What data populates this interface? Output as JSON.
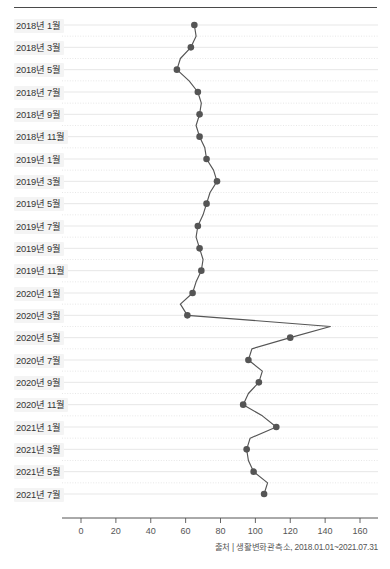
{
  "chart_data": {
    "type": "line",
    "orientation": "horizontal-time-vertical",
    "title": "",
    "subtitle": "",
    "xlabel": "",
    "ylabel": "",
    "xlim": [
      0,
      160
    ],
    "ylim_categories_order": "top-to-bottom chronological",
    "grid": true,
    "grid_axis": "y",
    "legend": null,
    "legend_position": "none",
    "xticks": [
      0,
      20,
      40,
      60,
      80,
      100,
      120,
      140,
      160
    ],
    "xtick_labels": [
      "0",
      "20",
      "40",
      "60",
      "80",
      "100",
      "120",
      "140",
      "160"
    ],
    "ytick_labels": [
      "2018년 1월",
      "2018년 3월",
      "2018년 5월",
      "2018년 7월",
      "2018년 9월",
      "2018년 11월",
      "2019년 1월",
      "2019년 3월",
      "2019년 5월",
      "2019년 7월",
      "2019년 9월",
      "2019년 11월",
      "2020년 1월",
      "2020년 3월",
      "2020년 5월",
      "2020년 7월",
      "2020년 9월",
      "2020년 11월",
      "2021년 1월",
      "2021년 3월",
      "2021년 5월",
      "2021년 7월"
    ],
    "categories": [
      "2018년 1월",
      "2018년 2월",
      "2018년 3월",
      "2018년 4월",
      "2018년 5월",
      "2018년 6월",
      "2018년 7월",
      "2018년 8월",
      "2018년 9월",
      "2018년 10월",
      "2018년 11월",
      "2018년 12월",
      "2019년 1월",
      "2019년 2월",
      "2019년 3월",
      "2019년 4월",
      "2019년 5월",
      "2019년 6월",
      "2019년 7월",
      "2019년 8월",
      "2019년 9월",
      "2019년 10월",
      "2019년 11월",
      "2019년 12월",
      "2020년 1월",
      "2020년 2월",
      "2020년 3월",
      "2020년 4월",
      "2020년 5월",
      "2020년 6월",
      "2020년 7월",
      "2020년 8월",
      "2020년 9월",
      "2020년 10월",
      "2020년 11월",
      "2020년 12월",
      "2021년 1월",
      "2021년 2월",
      "2021년 3월",
      "2021년 4월",
      "2021년 5월",
      "2021년 6월",
      "2021년 7월"
    ],
    "values": [
      65,
      66,
      63,
      57,
      55,
      62,
      67,
      69,
      68,
      66,
      68,
      71,
      72,
      76,
      78,
      74,
      72,
      70,
      67,
      66,
      68,
      70,
      69,
      66,
      64,
      57,
      61,
      143,
      120,
      98,
      96,
      104,
      102,
      96,
      93,
      104,
      112,
      97,
      95,
      96,
      99,
      107,
      105
    ],
    "series_name": "",
    "marker": "circle",
    "marker_every": 2,
    "line_color": "#555555",
    "marker_color": "#555555"
  },
  "source": {
    "text": "출처 | 생활변화관측소, 2018.01.01~2021.07.31"
  },
  "style": {
    "background": "#ffffff",
    "grid_color": "#dcdcdc",
    "axis_color": "#555555",
    "text_color": "#333333",
    "rule_color": "#4a4a4a"
  }
}
